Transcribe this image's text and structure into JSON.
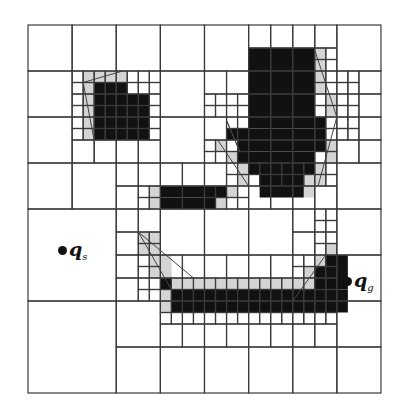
{
  "figure": {
    "kind": "quadtree-decomposition",
    "origin": [
      28,
      25
    ],
    "unit_w": 11.03,
    "unit_h": 11.5,
    "grid_units": 32,
    "colors": {
      "line": "#3a3a3a",
      "obstacle": "#111111",
      "inflated": "#d4d4d4",
      "background": "#ffffff"
    },
    "obstacles": [
      [
        6,
        5,
        3,
        1
      ],
      [
        6,
        6,
        5,
        4
      ],
      [
        20,
        2,
        6,
        6
      ],
      [
        20,
        8,
        7,
        1
      ],
      [
        18,
        9,
        9,
        1
      ],
      [
        19,
        10,
        8,
        1
      ],
      [
        19,
        11,
        7,
        1
      ],
      [
        20,
        12,
        6,
        1
      ],
      [
        21,
        13,
        4,
        2
      ],
      [
        12,
        14,
        6,
        1
      ],
      [
        12,
        15,
        5,
        1
      ],
      [
        12,
        22,
        1,
        1
      ],
      [
        13,
        23,
        16,
        2
      ],
      [
        27,
        20,
        2,
        3
      ],
      [
        26,
        21,
        1,
        2
      ]
    ],
    "inflated": [
      [
        5,
        4,
        4,
        1
      ],
      [
        5,
        5,
        1,
        5
      ],
      [
        26,
        2,
        1,
        2
      ],
      [
        26,
        4,
        1,
        2
      ],
      [
        27,
        6,
        1,
        2
      ],
      [
        27,
        10,
        1,
        2
      ],
      [
        26,
        12,
        1,
        2
      ],
      [
        25,
        13,
        1,
        2
      ],
      [
        19,
        12,
        1,
        2
      ],
      [
        18,
        11,
        1,
        1
      ],
      [
        17,
        10,
        1,
        1
      ],
      [
        11,
        14,
        1,
        2
      ],
      [
        18,
        14,
        1,
        1
      ],
      [
        17,
        15,
        1,
        1
      ],
      [
        10,
        18,
        2,
        2
      ],
      [
        11,
        20,
        2,
        2
      ],
      [
        12,
        21,
        1,
        1
      ],
      [
        13,
        22,
        14,
        1
      ],
      [
        12,
        23,
        1,
        2
      ],
      [
        25,
        21,
        1,
        1
      ],
      [
        26,
        20,
        1,
        1
      ],
      [
        27,
        19,
        1,
        1
      ]
    ],
    "cells": [
      [
        0,
        0,
        4
      ],
      [
        4,
        0,
        4
      ],
      [
        8,
        0,
        4
      ],
      [
        12,
        0,
        4
      ],
      [
        16,
        0,
        4
      ],
      [
        20,
        0,
        2
      ],
      [
        22,
        0,
        2
      ],
      [
        24,
        0,
        2
      ],
      [
        26,
        0,
        2
      ],
      [
        28,
        0,
        4
      ],
      [
        20,
        2,
        2
      ],
      [
        22,
        2,
        2
      ],
      [
        24,
        2,
        2
      ],
      [
        26,
        2,
        1
      ],
      [
        27,
        2,
        1
      ],
      [
        26,
        3,
        1
      ],
      [
        27,
        3,
        1
      ],
      [
        0,
        4,
        4
      ],
      [
        4,
        4,
        1
      ],
      [
        5,
        4,
        1
      ],
      [
        6,
        4,
        1
      ],
      [
        7,
        4,
        1
      ],
      [
        8,
        4,
        1
      ],
      [
        9,
        4,
        1
      ],
      [
        10,
        4,
        1
      ],
      [
        11,
        4,
        1
      ],
      [
        4,
        5,
        1
      ],
      [
        5,
        5,
        1
      ],
      [
        6,
        5,
        1
      ],
      [
        7,
        5,
        1
      ],
      [
        8,
        5,
        1
      ],
      [
        9,
        5,
        1
      ],
      [
        10,
        5,
        1
      ],
      [
        11,
        5,
        1
      ],
      [
        4,
        6,
        1
      ],
      [
        5,
        6,
        1
      ],
      [
        6,
        6,
        1
      ],
      [
        7,
        6,
        1
      ],
      [
        8,
        6,
        1
      ],
      [
        9,
        6,
        1
      ],
      [
        10,
        6,
        1
      ],
      [
        11,
        6,
        1
      ],
      [
        4,
        7,
        1
      ],
      [
        5,
        7,
        1
      ],
      [
        6,
        7,
        1
      ],
      [
        7,
        7,
        1
      ],
      [
        8,
        7,
        1
      ],
      [
        9,
        7,
        1
      ],
      [
        10,
        7,
        1
      ],
      [
        11,
        7,
        1
      ],
      [
        12,
        4,
        4
      ],
      [
        16,
        4,
        2
      ],
      [
        18,
        4,
        2
      ],
      [
        20,
        4,
        2
      ],
      [
        22,
        4,
        2
      ],
      [
        24,
        4,
        2
      ],
      [
        26,
        4,
        1
      ],
      [
        27,
        4,
        1
      ],
      [
        26,
        5,
        1
      ],
      [
        27,
        5,
        1
      ],
      [
        28,
        4,
        1
      ],
      [
        29,
        4,
        1
      ],
      [
        28,
        5,
        1
      ],
      [
        29,
        5,
        1
      ],
      [
        30,
        4,
        2
      ],
      [
        16,
        6,
        1
      ],
      [
        17,
        6,
        1
      ],
      [
        18,
        6,
        1
      ],
      [
        19,
        6,
        1
      ],
      [
        16,
        7,
        1
      ],
      [
        17,
        7,
        1
      ],
      [
        18,
        7,
        1
      ],
      [
        19,
        7,
        1
      ],
      [
        20,
        6,
        2
      ],
      [
        22,
        6,
        2
      ],
      [
        24,
        6,
        2
      ],
      [
        26,
        6,
        1
      ],
      [
        27,
        6,
        1
      ],
      [
        26,
        7,
        1
      ],
      [
        27,
        7,
        1
      ],
      [
        28,
        6,
        1
      ],
      [
        29,
        6,
        1
      ],
      [
        28,
        7,
        1
      ],
      [
        29,
        7,
        1
      ],
      [
        30,
        6,
        2
      ],
      [
        0,
        8,
        4
      ],
      [
        4,
        8,
        1
      ],
      [
        5,
        8,
        1
      ],
      [
        6,
        8,
        1
      ],
      [
        7,
        8,
        1
      ],
      [
        8,
        8,
        1
      ],
      [
        9,
        8,
        1
      ],
      [
        10,
        8,
        1
      ],
      [
        11,
        8,
        1
      ],
      [
        4,
        9,
        1
      ],
      [
        5,
        9,
        1
      ],
      [
        6,
        9,
        1
      ],
      [
        7,
        9,
        1
      ],
      [
        8,
        9,
        1
      ],
      [
        9,
        9,
        1
      ],
      [
        10,
        9,
        1
      ],
      [
        11,
        9,
        1
      ],
      [
        4,
        10,
        2
      ],
      [
        6,
        10,
        2
      ],
      [
        8,
        10,
        2
      ],
      [
        10,
        10,
        2
      ],
      [
        12,
        8,
        4
      ],
      [
        16,
        8,
        2
      ],
      [
        18,
        8,
        1
      ],
      [
        19,
        8,
        1
      ],
      [
        18,
        9,
        1
      ],
      [
        19,
        9,
        1
      ],
      [
        16,
        10,
        1
      ],
      [
        17,
        10,
        1
      ],
      [
        18,
        10,
        1
      ],
      [
        19,
        10,
        1
      ],
      [
        16,
        11,
        1
      ],
      [
        17,
        11,
        1
      ],
      [
        18,
        11,
        1
      ],
      [
        19,
        11,
        1
      ],
      [
        20,
        8,
        2
      ],
      [
        22,
        8,
        2
      ],
      [
        24,
        8,
        2
      ],
      [
        26,
        8,
        1
      ],
      [
        27,
        8,
        1
      ],
      [
        26,
        9,
        1
      ],
      [
        27,
        9,
        1
      ],
      [
        20,
        10,
        2
      ],
      [
        22,
        10,
        2
      ],
      [
        24,
        10,
        2
      ],
      [
        26,
        10,
        1
      ],
      [
        27,
        10,
        1
      ],
      [
        26,
        11,
        1
      ],
      [
        27,
        11,
        1
      ],
      [
        28,
        8,
        1
      ],
      [
        29,
        8,
        1
      ],
      [
        28,
        9,
        1
      ],
      [
        29,
        9,
        1
      ],
      [
        30,
        8,
        2
      ],
      [
        28,
        10,
        2
      ],
      [
        30,
        10,
        2
      ],
      [
        0,
        12,
        4
      ],
      [
        4,
        12,
        4
      ],
      [
        8,
        12,
        2
      ],
      [
        10,
        12,
        2
      ],
      [
        8,
        14,
        2
      ],
      [
        10,
        14,
        1
      ],
      [
        11,
        14,
        1
      ],
      [
        10,
        15,
        1
      ],
      [
        11,
        15,
        1
      ],
      [
        12,
        12,
        2
      ],
      [
        14,
        12,
        2
      ],
      [
        12,
        14,
        2
      ],
      [
        14,
        14,
        2
      ],
      [
        16,
        12,
        2
      ],
      [
        18,
        12,
        1
      ],
      [
        19,
        12,
        1
      ],
      [
        18,
        13,
        1
      ],
      [
        19,
        13,
        1
      ],
      [
        16,
        14,
        1
      ],
      [
        17,
        14,
        1
      ],
      [
        18,
        14,
        1
      ],
      [
        19,
        14,
        1
      ],
      [
        16,
        15,
        1
      ],
      [
        17,
        15,
        1
      ],
      [
        18,
        15,
        1
      ],
      [
        19,
        15,
        1
      ],
      [
        20,
        12,
        1
      ],
      [
        21,
        12,
        1
      ],
      [
        22,
        12,
        1
      ],
      [
        23,
        12,
        1
      ],
      [
        24,
        12,
        1
      ],
      [
        25,
        12,
        1
      ],
      [
        26,
        12,
        1
      ],
      [
        27,
        12,
        1
      ],
      [
        20,
        13,
        1
      ],
      [
        21,
        13,
        1
      ],
      [
        22,
        13,
        1
      ],
      [
        23,
        13,
        1
      ],
      [
        24,
        13,
        1
      ],
      [
        25,
        13,
        1
      ],
      [
        26,
        13,
        1
      ],
      [
        27,
        13,
        1
      ],
      [
        20,
        14,
        2
      ],
      [
        22,
        14,
        2
      ],
      [
        24,
        14,
        2
      ],
      [
        26,
        14,
        2
      ],
      [
        28,
        12,
        4
      ],
      [
        0,
        16,
        8
      ],
      [
        8,
        16,
        2
      ],
      [
        10,
        16,
        2
      ],
      [
        8,
        18,
        2
      ],
      [
        10,
        18,
        1
      ],
      [
        11,
        18,
        1
      ],
      [
        10,
        19,
        1
      ],
      [
        11,
        19,
        1
      ],
      [
        12,
        16,
        4
      ],
      [
        16,
        16,
        4
      ],
      [
        20,
        16,
        4
      ],
      [
        24,
        16,
        2
      ],
      [
        26,
        16,
        1
      ],
      [
        27,
        16,
        1
      ],
      [
        26,
        17,
        1
      ],
      [
        27,
        17,
        1
      ],
      [
        24,
        18,
        2
      ],
      [
        26,
        18,
        1
      ],
      [
        27,
        18,
        1
      ],
      [
        26,
        19,
        1
      ],
      [
        27,
        19,
        1
      ],
      [
        28,
        16,
        4
      ],
      [
        8,
        20,
        2
      ],
      [
        10,
        20,
        1
      ],
      [
        11,
        20,
        1
      ],
      [
        10,
        21,
        1
      ],
      [
        11,
        21,
        1
      ],
      [
        8,
        22,
        2
      ],
      [
        10,
        22,
        1
      ],
      [
        11,
        22,
        1
      ],
      [
        10,
        23,
        1
      ],
      [
        11,
        23,
        1
      ],
      [
        12,
        20,
        2
      ],
      [
        14,
        20,
        2
      ],
      [
        12,
        22,
        1
      ],
      [
        13,
        22,
        1
      ],
      [
        12,
        23,
        1
      ],
      [
        13,
        23,
        1
      ],
      [
        14,
        22,
        1
      ],
      [
        15,
        22,
        1
      ],
      [
        14,
        23,
        1
      ],
      [
        15,
        23,
        1
      ],
      [
        16,
        20,
        2
      ],
      [
        18,
        20,
        2
      ],
      [
        16,
        22,
        1
      ],
      [
        17,
        22,
        1
      ],
      [
        18,
        22,
        1
      ],
      [
        19,
        22,
        1
      ],
      [
        16,
        23,
        1
      ],
      [
        17,
        23,
        1
      ],
      [
        18,
        23,
        1
      ],
      [
        19,
        23,
        1
      ],
      [
        20,
        20,
        2
      ],
      [
        22,
        20,
        2
      ],
      [
        20,
        22,
        1
      ],
      [
        21,
        22,
        1
      ],
      [
        22,
        22,
        1
      ],
      [
        23,
        22,
        1
      ],
      [
        20,
        23,
        1
      ],
      [
        21,
        23,
        1
      ],
      [
        22,
        23,
        1
      ],
      [
        23,
        23,
        1
      ],
      [
        24,
        20,
        1
      ],
      [
        25,
        20,
        1
      ],
      [
        26,
        20,
        1
      ],
      [
        27,
        20,
        1
      ],
      [
        24,
        21,
        1
      ],
      [
        25,
        21,
        1
      ],
      [
        26,
        21,
        1
      ],
      [
        27,
        21,
        1
      ],
      [
        24,
        22,
        1
      ],
      [
        25,
        22,
        1
      ],
      [
        26,
        22,
        1
      ],
      [
        27,
        22,
        1
      ],
      [
        24,
        23,
        1
      ],
      [
        25,
        23,
        1
      ],
      [
        26,
        23,
        1
      ],
      [
        27,
        23,
        1
      ],
      [
        28,
        20,
        4
      ],
      [
        0,
        24,
        8
      ],
      [
        8,
        24,
        4
      ],
      [
        12,
        24,
        1
      ],
      [
        13,
        24,
        1
      ],
      [
        14,
        24,
        1
      ],
      [
        15,
        24,
        1
      ],
      [
        16,
        24,
        1
      ],
      [
        17,
        24,
        1
      ],
      [
        18,
        24,
        1
      ],
      [
        19,
        24,
        1
      ],
      [
        20,
        24,
        1
      ],
      [
        21,
        24,
        1
      ],
      [
        22,
        24,
        1
      ],
      [
        23,
        24,
        1
      ],
      [
        24,
        24,
        1
      ],
      [
        25,
        24,
        1
      ],
      [
        26,
        24,
        1
      ],
      [
        27,
        24,
        1
      ],
      [
        12,
        25,
        1
      ],
      [
        13,
        25,
        1
      ],
      [
        14,
        25,
        1
      ],
      [
        15,
        25,
        1
      ],
      [
        16,
        25,
        1
      ],
      [
        17,
        25,
        1
      ],
      [
        18,
        25,
        1
      ],
      [
        19,
        25,
        1
      ],
      [
        20,
        25,
        1
      ],
      [
        21,
        25,
        1
      ],
      [
        22,
        25,
        1
      ],
      [
        23,
        25,
        1
      ],
      [
        24,
        25,
        1
      ],
      [
        25,
        25,
        1
      ],
      [
        26,
        25,
        1
      ],
      [
        27,
        25,
        1
      ],
      [
        12,
        26,
        2
      ],
      [
        14,
        26,
        2
      ],
      [
        16,
        26,
        2
      ],
      [
        18,
        26,
        2
      ],
      [
        20,
        26,
        2
      ],
      [
        22,
        26,
        2
      ],
      [
        24,
        26,
        2
      ],
      [
        26,
        26,
        2
      ],
      [
        28,
        24,
        4
      ],
      [
        8,
        28,
        4
      ],
      [
        12,
        28,
        4
      ],
      [
        16,
        28,
        4
      ],
      [
        20,
        28,
        4
      ],
      [
        24,
        28,
        4
      ],
      [
        28,
        28,
        4
      ]
    ],
    "inflation_lines": [
      [
        [
          5,
          5
        ],
        [
          8.6,
          4
        ]
      ],
      [
        [
          5,
          5
        ],
        [
          6,
          10
        ]
      ],
      [
        [
          26,
          2.2
        ],
        [
          28,
          8
        ]
      ],
      [
        [
          28,
          8
        ],
        [
          26.3,
          14
        ]
      ],
      [
        [
          19.2,
          11
        ],
        [
          18,
          8.3
        ]
      ],
      [
        [
          18,
          8.3
        ],
        [
          19.2,
          11
        ]
      ],
      [
        [
          17.2,
          10
        ],
        [
          20,
          14
        ]
      ],
      [
        [
          10,
          18
        ],
        [
          13,
          23
        ]
      ],
      [
        [
          10,
          18
        ],
        [
          15,
          22
        ]
      ],
      [
        [
          27,
          20
        ],
        [
          24,
          24
        ]
      ]
    ]
  },
  "labels": {
    "start": {
      "symbol": "q",
      "subscript": "s"
    },
    "goal": {
      "symbol": "q",
      "subscript": "g"
    }
  }
}
